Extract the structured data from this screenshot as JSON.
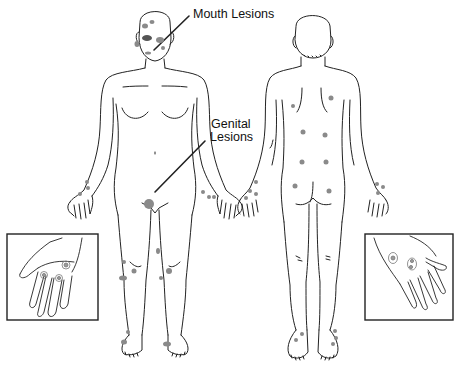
{
  "figure": {
    "type": "medical-illustration",
    "views": [
      "front",
      "back"
    ],
    "labels": {
      "mouth": "Mouth Lesions",
      "genital_line1": "Genital",
      "genital_line2": "Lesions"
    },
    "insets": [
      {
        "name": "left-hand-palm-inset",
        "content": "palm with lesions"
      },
      {
        "name": "right-hand-back-inset",
        "content": "back of hand with lesions"
      }
    ],
    "colors": {
      "outline": "#222222",
      "lesion": "#8a8a8a",
      "background": "#ffffff"
    }
  }
}
